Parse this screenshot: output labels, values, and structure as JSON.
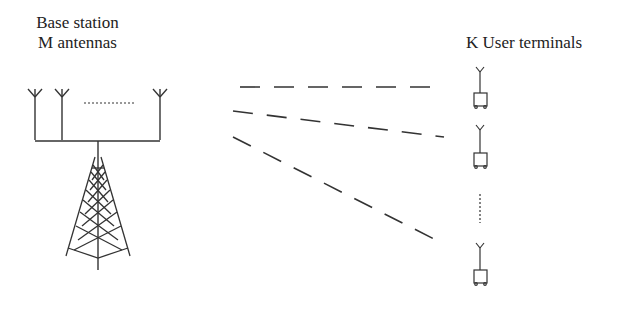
{
  "base_station": {
    "title_line1": "Base station",
    "title_line2": "M antennas",
    "antenna_count_label": "M",
    "ellipsis": "..........."
  },
  "users": {
    "title": "K User terminals",
    "count_label": "K"
  },
  "links": [
    {
      "from": [
        240,
        87
      ],
      "to": [
        435,
        87
      ]
    },
    {
      "from": [
        233,
        111
      ],
      "to": [
        444,
        137
      ]
    },
    {
      "from": [
        233,
        137
      ],
      "to": [
        438,
        241
      ]
    }
  ],
  "colors": {
    "stroke": "#333333",
    "background": "#ffffff"
  }
}
